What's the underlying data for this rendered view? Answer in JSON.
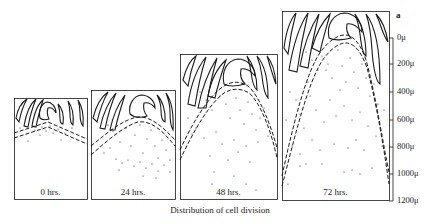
{
  "figure": {
    "letter": "a",
    "caption": "Distribution of cell division",
    "panels": [
      {
        "label": "0 hrs.",
        "box": [
          14,
          98,
          73,
          101
        ]
      },
      {
        "label": "24 hrs.",
        "box": [
          91,
          90,
          84,
          109
        ]
      },
      {
        "label": "48 hrs.",
        "box": [
          180,
          54,
          97,
          145
        ]
      },
      {
        "label": "72 hrs.",
        "box": [
          282,
          11,
          107,
          189
        ]
      }
    ],
    "axis": {
      "unit": "μ",
      "ticks": [
        {
          "label": "0μ",
          "y": 38
        },
        {
          "label": "200μ",
          "y": 64
        },
        {
          "label": "400μ",
          "y": 92
        },
        {
          "label": "600μ",
          "y": 120
        },
        {
          "label": "800μ",
          "y": 147
        },
        {
          "label": "1000μ",
          "y": 174
        },
        {
          "label": "1200μ",
          "y": 201
        }
      ]
    },
    "colors": {
      "ink": "#1a1a1a",
      "background": "#ffffff"
    }
  }
}
